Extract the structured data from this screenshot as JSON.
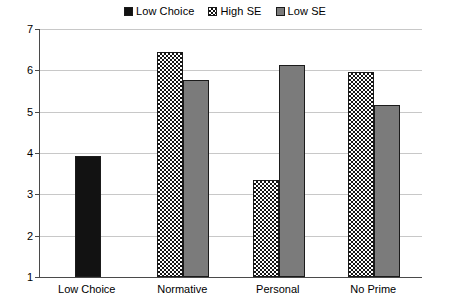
{
  "chart_data": {
    "type": "bar",
    "title": "",
    "subtitle": "",
    "xlabel": "",
    "ylabel": "",
    "categories": [
      "Low Choice",
      "Normative",
      "Personal",
      "No Prime"
    ],
    "series": [
      {
        "name": "Low Choice",
        "swatch": "solid-black",
        "color": "#121212",
        "values": [
          3.92,
          null,
          null,
          null
        ]
      },
      {
        "name": "High SE",
        "swatch": "checkered",
        "color": "#151515",
        "values": [
          null,
          6.45,
          3.35,
          5.95
        ]
      },
      {
        "name": "Low SE",
        "swatch": "solid-gray",
        "color": "#7b7b7b",
        "values": [
          null,
          5.77,
          6.13,
          5.15
        ]
      }
    ],
    "ylim": [
      1,
      7
    ],
    "yticks": [
      1,
      2,
      3,
      4,
      5,
      6,
      7
    ],
    "ytick_labels": [
      "1",
      "2",
      "3",
      "4",
      "5",
      "6",
      "7"
    ],
    "grid": true,
    "legend_position": "top-center",
    "legend": [
      {
        "label": "Low Choice",
        "swatch": "solid-black"
      },
      {
        "label": "High SE",
        "swatch": "checkered"
      },
      {
        "label": "Low SE",
        "swatch": "solid-gray"
      }
    ]
  },
  "legend": {
    "items": [
      {
        "label": "Low Choice"
      },
      {
        "label": "High SE"
      },
      {
        "label": "Low SE"
      }
    ]
  },
  "axes": {
    "y_tick_labels": [
      "7",
      "6",
      "5",
      "4",
      "3",
      "2",
      "1"
    ],
    "x_tick_labels": [
      "Low Choice",
      "Normative",
      "Personal",
      "No Prime"
    ]
  }
}
